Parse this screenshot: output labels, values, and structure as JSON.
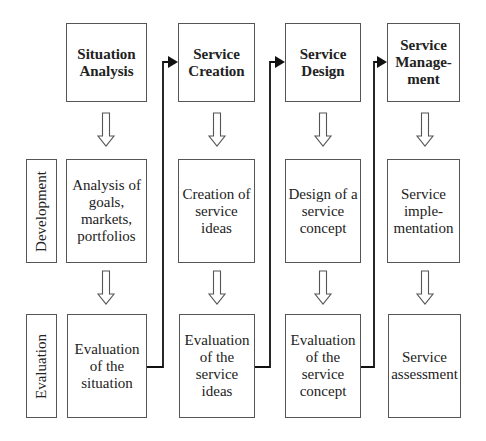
{
  "diagram": {
    "row_labels": [
      "Development",
      "Evaluation"
    ],
    "phases": [
      {
        "title": "Situation\nAnalysis",
        "development": "Analysis of\ngoals,\nmarkets,\nportfolios",
        "evaluation": "Evaluation\nof the\nsituation"
      },
      {
        "title": "Service\nCreation",
        "development": "Creation of\nservice ideas",
        "evaluation": "Evaluation\nof the\nservice ideas"
      },
      {
        "title": "Service\nDesign",
        "development": "Design of a\nservice\nconcept",
        "evaluation": "Evaluation\nof the\nservice\nconcept"
      },
      {
        "title": "Service\nManage-\nment",
        "development": "Service\nimple-\nmentation",
        "evaluation": "Service\nassessment"
      }
    ],
    "connectors": [
      {
        "from": "evaluation-1",
        "to": "phase-2"
      },
      {
        "from": "evaluation-2",
        "to": "phase-3"
      },
      {
        "from": "evaluation-3",
        "to": "phase-4"
      }
    ],
    "colors": {
      "border": "#555555",
      "arrow": "#111111",
      "background": "#ffffff"
    }
  }
}
